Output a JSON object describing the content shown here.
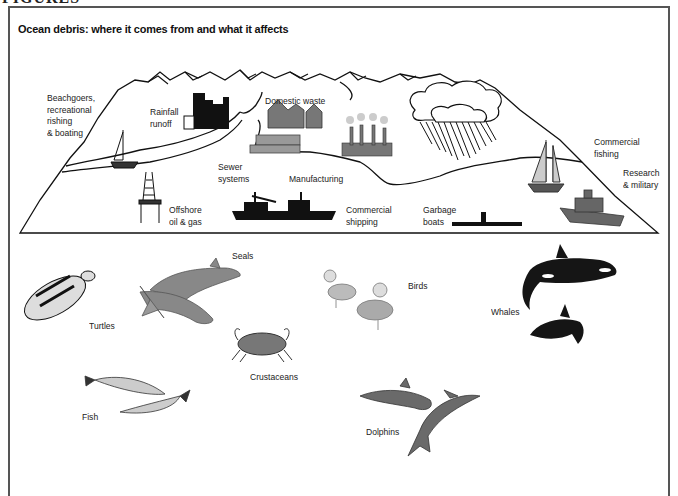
{
  "page_header": "FIGURES",
  "figure": {
    "title": "Ocean debris: where it comes from and what it affects"
  },
  "sources": {
    "beachgoers": [
      "Beachgoers,",
      "recreational",
      "rishing",
      "& boating"
    ],
    "rainfall": [
      "Rainfall",
      "runoff"
    ],
    "domestic": "Domestic waste",
    "sewer": [
      "Sewer",
      "systems"
    ],
    "manufacturing": "Manufacturing",
    "offshore": [
      "Offshore",
      "oil & gas"
    ],
    "shipping": [
      "Commercial",
      "shipping"
    ],
    "garbage": [
      "Garbage",
      "boats"
    ],
    "fishing": [
      "Commercial",
      "fishing"
    ],
    "research": [
      "Research",
      "& military"
    ]
  },
  "affected": {
    "turtles": "Turtles",
    "seals": "Seals",
    "birds": "Birds",
    "whales": "Whales",
    "crustaceans": "Crustaceans",
    "fish": "Fish",
    "dolphins": "Dolphins"
  },
  "colors": {
    "line": "#111111",
    "frame": "#555555",
    "animal_gray": "#7a7a7a",
    "dark": "#151515"
  }
}
